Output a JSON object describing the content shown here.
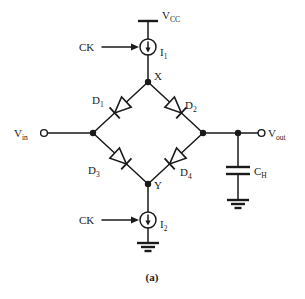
{
  "figure": {
    "caption": "(a)",
    "type": "circuit-schematic",
    "stroke_color": "#1a1a1a",
    "background_color": "#ffffff"
  },
  "labels": {
    "vcc": {
      "base": "V",
      "sub": "CC"
    },
    "i1": {
      "base": "I",
      "sub": "1"
    },
    "i2": {
      "base": "I",
      "sub": "2"
    },
    "ck_top": "CK",
    "ck_bottom": "CK",
    "node_x": "X",
    "node_y": "Y",
    "vin": {
      "base": "V",
      "sub": "in"
    },
    "vout": {
      "base": "V",
      "sub": "out"
    },
    "ch": {
      "base": "C",
      "sub": "H"
    },
    "d1": {
      "base": "D",
      "sub": "1"
    },
    "d2": {
      "base": "D",
      "sub": "2"
    },
    "d3": {
      "base": "D",
      "sub": "3"
    },
    "d4": {
      "base": "D",
      "sub": "4"
    }
  },
  "components": [
    {
      "id": "vcc-rail",
      "name": "supply-rail",
      "label": "V_CC"
    },
    {
      "id": "i1",
      "name": "current-source",
      "label": "I_1",
      "direction": "down"
    },
    {
      "id": "i2",
      "name": "current-source",
      "label": "I_2",
      "direction": "down"
    },
    {
      "id": "d1",
      "name": "diode",
      "label": "D_1",
      "orientation": "down-left"
    },
    {
      "id": "d2",
      "name": "diode",
      "label": "D_2",
      "orientation": "down-right"
    },
    {
      "id": "d3",
      "name": "diode",
      "label": "D_3",
      "orientation": "down-right"
    },
    {
      "id": "d4",
      "name": "diode",
      "label": "D_4",
      "orientation": "down-left"
    },
    {
      "id": "ch",
      "name": "capacitor",
      "label": "C_H"
    },
    {
      "id": "gnd-ch",
      "name": "ground"
    },
    {
      "id": "gnd-i2",
      "name": "ground"
    }
  ],
  "terminals": [
    {
      "id": "vin",
      "label": "V_in",
      "style": "open-circle",
      "side": "left"
    },
    {
      "id": "vout",
      "label": "V_out",
      "style": "open-circle",
      "side": "right"
    }
  ],
  "nodes": [
    {
      "id": "x",
      "label": "X",
      "style": "filled-dot"
    },
    {
      "id": "y",
      "label": "Y",
      "style": "filled-dot"
    },
    {
      "id": "left",
      "label": "",
      "style": "filled-dot"
    },
    {
      "id": "right",
      "label": "",
      "style": "filled-dot"
    },
    {
      "id": "ch-tap",
      "label": "",
      "style": "filled-dot"
    }
  ]
}
